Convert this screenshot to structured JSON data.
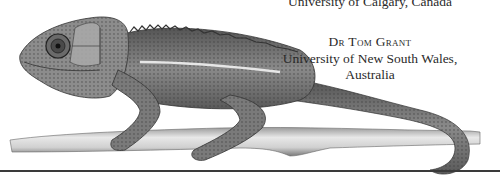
{
  "credits": {
    "affiliation_1": "University of Calgary, Canada",
    "name": "Dr Tom Grant",
    "affiliation_2_line1": "University of New South Wales,",
    "affiliation_2_line2": "Australia"
  },
  "illustration": {
    "subject": "chameleon on branch",
    "style": "grayscale pencil drawing"
  },
  "colors": {
    "background": "#ffffff",
    "text": "#2a2a2a",
    "rule": "#3a3a3a"
  }
}
